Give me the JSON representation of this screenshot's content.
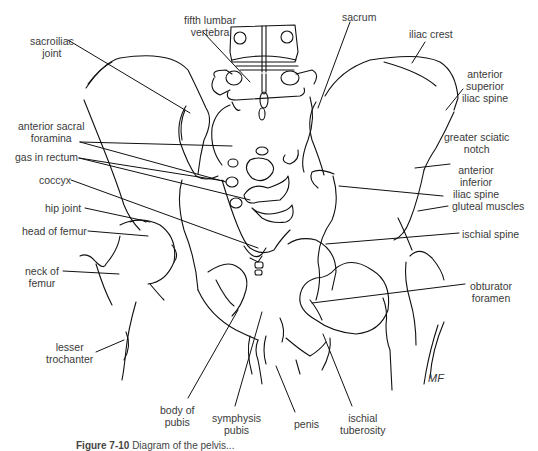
{
  "figure": {
    "caption_number": "Figure 7-10",
    "caption_text": "Diagram of the pelvis...",
    "artist_signature": "MF"
  },
  "labels": {
    "fifth_lumbar_vertebra": [
      "fifth lumbar",
      "vertebra"
    ],
    "sacrum": "sacrum",
    "sacroiliac_joint": [
      "sacroiliac",
      "joint"
    ],
    "iliac_crest": "iliac crest",
    "anterior_superior_iliac_spine": [
      "anterior",
      "superior",
      "iliac spine"
    ],
    "anterior_sacral_foramina": [
      "anterior sacral",
      "foramina"
    ],
    "greater_sciatic_notch": [
      "greater sciatic",
      "notch"
    ],
    "gas_in_rectum": "gas in rectum",
    "anterior_inferior_iliac_spine": [
      "anterior",
      "inferior",
      "iliac spine"
    ],
    "coccyx": "coccyx",
    "gluteal_muscles": "gluteal muscles",
    "hip_joint": "hip joint",
    "head_of_femur": "head of femur",
    "ischial_spine": "ischial spine",
    "neck_of_femur": [
      "neck of",
      "femur"
    ],
    "obturator_foramen": [
      "obturator",
      "foramen"
    ],
    "lesser_trochanter": [
      "lesser",
      "trochanter"
    ],
    "body_of_pubis": [
      "body of",
      "pubis"
    ],
    "symphysis_pubis": [
      "symphysis",
      "pubis"
    ],
    "penis": "penis",
    "ischial_tuberosity": [
      "ischial",
      "tuberosity"
    ]
  },
  "colors": {
    "line": "#111111",
    "label_text": "#3a3a3a",
    "background": "#ffffff"
  }
}
